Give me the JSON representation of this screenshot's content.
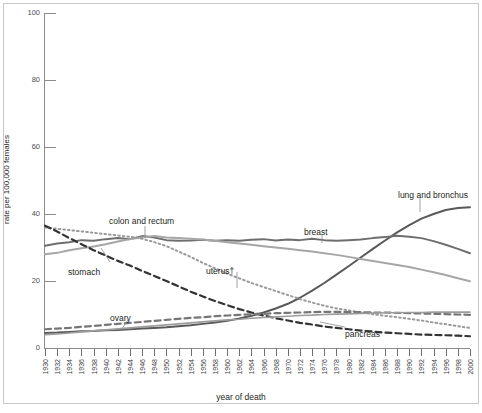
{
  "chart_data": {
    "type": "line",
    "title": "",
    "xlabel": "year of death",
    "ylabel": "rate per 100,000 females",
    "xlim": [
      1930,
      2000
    ],
    "ylim": [
      0,
      100
    ],
    "yticks": [
      0,
      20,
      40,
      60,
      80,
      100
    ],
    "grid": false,
    "legend": "inline-annotations",
    "x": [
      1930,
      1932,
      1934,
      1936,
      1938,
      1940,
      1942,
      1944,
      1946,
      1948,
      1950,
      1952,
      1954,
      1956,
      1958,
      1960,
      1962,
      1964,
      1966,
      1968,
      1970,
      1972,
      1974,
      1976,
      1978,
      1980,
      1982,
      1984,
      1986,
      1988,
      1990,
      1992,
      1994,
      1996,
      1998,
      2000
    ],
    "series": [
      {
        "name": "lung and bronchus",
        "style": "solid",
        "color": "#595959",
        "width": 2.0,
        "values": [
          4.5,
          4.6,
          4.8,
          5.0,
          5.1,
          5.3,
          5.4,
          5.6,
          5.8,
          6.0,
          6.2,
          6.5,
          6.8,
          7.2,
          7.6,
          8.1,
          8.8,
          9.6,
          10.6,
          11.8,
          13.2,
          15.0,
          17.1,
          19.4,
          21.9,
          24.4,
          27.0,
          29.6,
          32.1,
          34.5,
          36.7,
          38.6,
          40.0,
          41.2,
          41.8,
          42.0
        ]
      },
      {
        "name": "breast",
        "style": "solid",
        "color": "#6e6e6e",
        "width": 2.0,
        "values": [
          30.5,
          31.2,
          31.6,
          32.2,
          32.0,
          32.5,
          32.8,
          32.5,
          33.4,
          33.0,
          32.2,
          32.0,
          32.1,
          32.3,
          32.0,
          32.2,
          32.0,
          32.3,
          32.5,
          32.1,
          32.4,
          32.2,
          32.6,
          32.2,
          32.0,
          32.2,
          32.4,
          32.8,
          33.1,
          33.5,
          33.2,
          32.8,
          31.9,
          30.8,
          29.6,
          28.3
        ]
      },
      {
        "name": "colon and rectum",
        "style": "solid",
        "color": "#a6a6a6",
        "width": 2.0,
        "values": [
          28.0,
          28.4,
          29.2,
          29.8,
          30.3,
          31.0,
          31.8,
          32.5,
          33.0,
          33.4,
          33.0,
          32.8,
          32.6,
          32.4,
          32.0,
          31.6,
          31.2,
          30.8,
          30.4,
          30.0,
          29.6,
          29.2,
          28.8,
          28.3,
          27.8,
          27.2,
          26.6,
          26.0,
          25.4,
          24.8,
          24.2,
          23.4,
          22.6,
          21.8,
          20.8,
          19.9
        ]
      },
      {
        "name": "uterus",
        "label": "uterus†",
        "style": "dotted",
        "color": "#9a9a9a",
        "width": 2.0,
        "values": [
          36.0,
          35.6,
          35.2,
          34.8,
          34.4,
          34.0,
          33.6,
          33.2,
          32.6,
          31.6,
          30.4,
          28.8,
          27.2,
          25.4,
          23.8,
          22.2,
          20.8,
          19.4,
          18.2,
          17.0,
          15.8,
          14.6,
          13.6,
          12.6,
          11.8,
          11.2,
          10.6,
          10.1,
          9.6,
          9.2,
          8.7,
          8.2,
          7.6,
          7.1,
          6.5,
          6.0
        ]
      },
      {
        "name": "stomach",
        "style": "dashed",
        "color": "#333333",
        "width": 2.2,
        "values": [
          36.5,
          34.8,
          32.8,
          31.0,
          29.2,
          27.6,
          26.0,
          24.6,
          23.0,
          21.5,
          20.0,
          18.4,
          16.8,
          15.4,
          14.0,
          12.8,
          11.6,
          10.6,
          9.7,
          8.9,
          8.2,
          7.5,
          7.0,
          6.4,
          6.0,
          5.6,
          5.2,
          4.9,
          4.6,
          4.4,
          4.2,
          4.0,
          3.9,
          3.8,
          3.7,
          3.5
        ]
      },
      {
        "name": "ovary",
        "style": "dashed",
        "color": "#767676",
        "width": 2.2,
        "values": [
          5.6,
          5.8,
          6.0,
          6.3,
          6.6,
          6.9,
          7.2,
          7.5,
          7.8,
          8.1,
          8.4,
          8.7,
          9.0,
          9.2,
          9.5,
          9.7,
          9.9,
          10.1,
          10.2,
          10.4,
          10.5,
          10.6,
          10.7,
          10.8,
          10.8,
          10.7,
          10.7,
          10.6,
          10.6,
          10.5,
          10.4,
          10.3,
          10.2,
          10.1,
          10.0,
          9.9
        ]
      },
      {
        "name": "pancreas",
        "style": "solid",
        "color": "#9d9d9d",
        "width": 1.6,
        "values": [
          4.0,
          4.2,
          4.5,
          4.8,
          5.1,
          5.4,
          5.7,
          6.0,
          6.3,
          6.6,
          6.9,
          7.2,
          7.5,
          7.8,
          8.1,
          8.4,
          8.6,
          8.9,
          9.1,
          9.3,
          9.5,
          9.7,
          9.8,
          10.0,
          10.1,
          10.2,
          10.3,
          10.4,
          10.5,
          10.5,
          10.6,
          10.6,
          10.7,
          10.7,
          10.7,
          10.7
        ]
      }
    ],
    "annotations": [
      {
        "text": "colon and rectum",
        "x": 109,
        "y": 216
      },
      {
        "text": "stomach",
        "x": 68,
        "y": 267
      },
      {
        "text": "uterus†",
        "x": 206,
        "y": 266
      },
      {
        "text": "ovary",
        "x": 110,
        "y": 313
      },
      {
        "text": "pancreas",
        "x": 345,
        "y": 329
      },
      {
        "text": "breast",
        "x": 304,
        "y": 227
      },
      {
        "text": "lung and bronchus",
        "x": 398,
        "y": 190
      }
    ],
    "xtick_labels": [
      "1930",
      "1932",
      "1934",
      "1936",
      "1938",
      "1940",
      "1942",
      "1944",
      "1946",
      "1948",
      "1950",
      "1952",
      "1954",
      "1956",
      "1958",
      "1960",
      "1962",
      "1964",
      "1966",
      "1968",
      "1970",
      "1972",
      "1974",
      "1976",
      "1978",
      "1980",
      "1982",
      "1984",
      "1986",
      "1988",
      "1990",
      "1992",
      "1994",
      "1996",
      "1998",
      "2000"
    ]
  },
  "caption": ""
}
